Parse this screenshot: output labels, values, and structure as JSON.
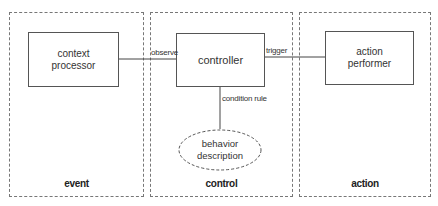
{
  "diagram": {
    "panels": [
      {
        "id": "event",
        "label": "event"
      },
      {
        "id": "control",
        "label": "control"
      },
      {
        "id": "action",
        "label": "action"
      }
    ],
    "nodes": {
      "context_processor": "context\nprocessor",
      "controller": "controller",
      "action_performer": "action\nperformer",
      "behavior_description": "behavior\ndescription"
    },
    "edges": {
      "observe": "observe",
      "trigger": "trigger",
      "condition_rule": "condition rule"
    },
    "colors": {
      "line": "#444444",
      "dashed_border": "#777777",
      "background": "#ffffff"
    }
  }
}
